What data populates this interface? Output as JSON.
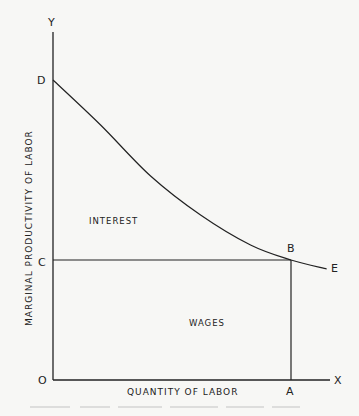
{
  "chart_data": {
    "type": "line",
    "title": "",
    "xlabel": "QUANTITY OF LABOR",
    "ylabel": "MARGINAL PRODUCTIVITY OF LABOR",
    "axis_end_labels": {
      "x": "X",
      "y": "Y",
      "origin": "O"
    },
    "points": {
      "D": "D",
      "C": "C",
      "B": "B",
      "E": "E",
      "A": "A"
    },
    "regions": {
      "upper": "INTEREST",
      "lower": "WAGES"
    },
    "curve": {
      "name": "marginal-productivity-curve",
      "from": "D",
      "to": "E",
      "x": [
        0,
        0.2,
        0.41,
        0.62,
        0.83,
        1.0,
        1.15
      ],
      "y": [
        1.0,
        0.85,
        0.68,
        0.55,
        0.45,
        0.4,
        0.37
      ]
    },
    "point_values": {
      "D": [
        0,
        1.0
      ],
      "C": [
        0,
        0.4
      ],
      "B": [
        1.0,
        0.4
      ],
      "A": [
        1.0,
        0
      ],
      "E": [
        1.15,
        0.37
      ]
    },
    "xlim": [
      0,
      1.15
    ],
    "ylim": [
      0,
      1.2
    ],
    "grid": false
  }
}
